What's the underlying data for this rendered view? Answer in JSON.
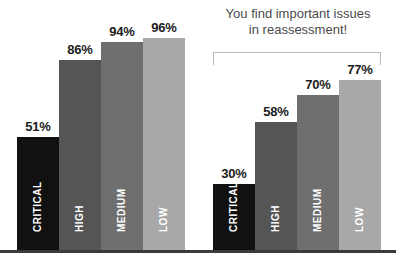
{
  "annotation": {
    "line1": "You find important issues",
    "line2": "in reassessment!"
  },
  "chart_data": {
    "type": "bar",
    "title": "",
    "xlabel": "",
    "ylabel": "",
    "ylim": [
      0,
      100
    ],
    "grid": false,
    "legend": "none",
    "value_suffix": "%",
    "categories": [
      "CRITICAL",
      "HIGH",
      "MEDIUM",
      "LOW"
    ],
    "category_colors": [
      "#111111",
      "#555555",
      "#6f6f6f",
      "#a8a8a8"
    ],
    "panels": [
      {
        "name": "initial-assessment",
        "values": [
          51,
          86,
          94,
          96
        ],
        "value_labels": [
          "51%",
          "86%",
          "94%",
          "96%"
        ],
        "category_labels": [
          "CRITICAL",
          "HIGH",
          "MEDIUM",
          "LOW"
        ]
      },
      {
        "name": "reassessment",
        "values": [
          30,
          58,
          70,
          77
        ],
        "value_labels": [
          "30%",
          "58%",
          "70%",
          "77%"
        ],
        "category_labels": [
          "CRITICAL",
          "HIGH",
          "MEDIUM",
          "LOW"
        ]
      }
    ],
    "series": [
      {
        "name": "initial-assessment",
        "values": [
          51,
          86,
          94,
          96
        ]
      },
      {
        "name": "reassessment",
        "values": [
          30,
          58,
          70,
          77
        ]
      }
    ],
    "annotations": [
      {
        "text": "You find important issues in reassessment!",
        "target": "reassessment",
        "style": "bracket"
      }
    ]
  },
  "colors": {
    "background": "#ffffff",
    "baseline": "#3a3a3a",
    "bracket": "#b9b9b9",
    "annotation_text": "#4a4a4a",
    "value_text": "#1c1c1c",
    "category_text": "#ffffff"
  }
}
